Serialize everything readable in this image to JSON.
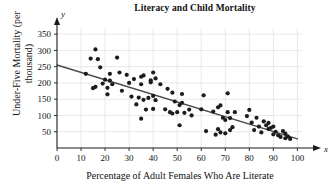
{
  "chart_data": {
    "type": "scatter",
    "title": "Literacy and Child Mortality",
    "xlabel": "Percentage of Adult Females Who Are Literate",
    "ylabel": "Under-Five Mortality (per thousand)",
    "x_axis_variable": "x",
    "y_axis_variable": "y",
    "xlim": [
      0,
      104
    ],
    "ylim": [
      0,
      375
    ],
    "xticks": [
      0,
      10,
      20,
      30,
      40,
      50,
      60,
      70,
      80,
      90,
      100
    ],
    "yticks": [
      50,
      100,
      150,
      200,
      250,
      300,
      350
    ],
    "grid": true,
    "legend": false,
    "point_color": "#1c1c1c",
    "trend_color": "#4a4a4a",
    "trend_line": {
      "label": "least-squares regression line",
      "x_start": 0,
      "y_start": 255,
      "x_end": 100,
      "y_end": 28
    },
    "points": [
      [
        12,
        228
      ],
      [
        14,
        275
      ],
      [
        15,
        184
      ],
      [
        16,
        303
      ],
      [
        16,
        188
      ],
      [
        17,
        273
      ],
      [
        18,
        248
      ],
      [
        19,
        198
      ],
      [
        20,
        210
      ],
      [
        21,
        185
      ],
      [
        21,
        165
      ],
      [
        22,
        228
      ],
      [
        22,
        207
      ],
      [
        23,
        196
      ],
      [
        25,
        278
      ],
      [
        26,
        232
      ],
      [
        27,
        176
      ],
      [
        29,
        225
      ],
      [
        30,
        200
      ],
      [
        31,
        158
      ],
      [
        32,
        212
      ],
      [
        33,
        134
      ],
      [
        34,
        155
      ],
      [
        35,
        219
      ],
      [
        35,
        196
      ],
      [
        35,
        90
      ],
      [
        36,
        223
      ],
      [
        36,
        148
      ],
      [
        37,
        118
      ],
      [
        38,
        154
      ],
      [
        39,
        202
      ],
      [
        39,
        208
      ],
      [
        40,
        232
      ],
      [
        40,
        160
      ],
      [
        40,
        120
      ],
      [
        41,
        214
      ],
      [
        41,
        147
      ],
      [
        43,
        196
      ],
      [
        45,
        119
      ],
      [
        46,
        182
      ],
      [
        47,
        110
      ],
      [
        48,
        106
      ],
      [
        48,
        170
      ],
      [
        49,
        143
      ],
      [
        50,
        110
      ],
      [
        51,
        132
      ],
      [
        51,
        70
      ],
      [
        52,
        166
      ],
      [
        52,
        139
      ],
      [
        53,
        108
      ],
      [
        55,
        118
      ],
      [
        56,
        100
      ],
      [
        60,
        119
      ],
      [
        61,
        162
      ],
      [
        62,
        52
      ],
      [
        65,
        112
      ],
      [
        66,
        41
      ],
      [
        67,
        125
      ],
      [
        67,
        58
      ],
      [
        68,
        48
      ],
      [
        68,
        131
      ],
      [
        69,
        93
      ],
      [
        70,
        86
      ],
      [
        70,
        45
      ],
      [
        71,
        110
      ],
      [
        71,
        168
      ],
      [
        72,
        55
      ],
      [
        72,
        92
      ],
      [
        73,
        64
      ],
      [
        74,
        110
      ],
      [
        79,
        98
      ],
      [
        80,
        117
      ],
      [
        81,
        78
      ],
      [
        82,
        55
      ],
      [
        83,
        93
      ],
      [
        84,
        66
      ],
      [
        85,
        48
      ],
      [
        86,
        82
      ],
      [
        87,
        70
      ],
      [
        88,
        59
      ],
      [
        88,
        77
      ],
      [
        89,
        62
      ],
      [
        90,
        66
      ],
      [
        90,
        42
      ],
      [
        91,
        50
      ],
      [
        92,
        39
      ],
      [
        93,
        34
      ],
      [
        94,
        52
      ],
      [
        95,
        30
      ],
      [
        95,
        44
      ],
      [
        96,
        36
      ],
      [
        97,
        28
      ]
    ]
  }
}
